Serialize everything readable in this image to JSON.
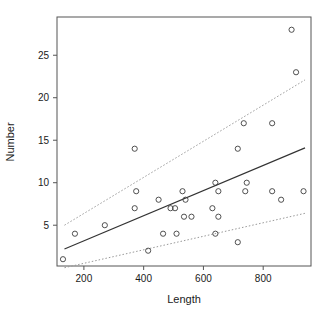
{
  "chart_data": {
    "type": "scatter",
    "title": "",
    "subtitle": "",
    "xlabel": "Length",
    "ylabel": "Number",
    "xlim": [
      110,
      960
    ],
    "ylim": [
      0.2,
      29.5
    ],
    "xticks": [
      200,
      400,
      600,
      800
    ],
    "yticks": [
      5,
      10,
      15,
      20,
      25
    ],
    "xtick_labels": [
      "200",
      "400",
      "600",
      "800"
    ],
    "ytick_labels": [
      "5",
      "10",
      "15",
      "20",
      "25"
    ],
    "grid": false,
    "legend": "none",
    "marker": "open-circle",
    "point_color": "#3d3d3d",
    "line_color": "#333333",
    "band_color": "#999999",
    "axis_color": "#555555",
    "points": [
      {
        "x": 130,
        "y": 1
      },
      {
        "x": 170,
        "y": 4
      },
      {
        "x": 270,
        "y": 5
      },
      {
        "x": 370,
        "y": 14
      },
      {
        "x": 375,
        "y": 9
      },
      {
        "x": 370,
        "y": 7
      },
      {
        "x": 415,
        "y": 2
      },
      {
        "x": 450,
        "y": 8
      },
      {
        "x": 465,
        "y": 4
      },
      {
        "x": 505,
        "y": 7
      },
      {
        "x": 490,
        "y": 7
      },
      {
        "x": 510,
        "y": 4
      },
      {
        "x": 530,
        "y": 9
      },
      {
        "x": 540,
        "y": 8
      },
      {
        "x": 535,
        "y": 6
      },
      {
        "x": 560,
        "y": 6
      },
      {
        "x": 630,
        "y": 7
      },
      {
        "x": 640,
        "y": 10
      },
      {
        "x": 650,
        "y": 9
      },
      {
        "x": 650,
        "y": 6
      },
      {
        "x": 640,
        "y": 4
      },
      {
        "x": 715,
        "y": 3
      },
      {
        "x": 715,
        "y": 14
      },
      {
        "x": 735,
        "y": 17
      },
      {
        "x": 745,
        "y": 10
      },
      {
        "x": 740,
        "y": 9
      },
      {
        "x": 830,
        "y": 17
      },
      {
        "x": 830,
        "y": 9
      },
      {
        "x": 860,
        "y": 8
      },
      {
        "x": 895,
        "y": 28
      },
      {
        "x": 910,
        "y": 23
      },
      {
        "x": 935,
        "y": 9
      }
    ],
    "fit_line": {
      "name": "regression line",
      "style": "solid",
      "x": [
        135,
        940
      ],
      "y": [
        2.2,
        14.1
      ]
    },
    "upper_band": {
      "name": "upper confidence band",
      "style": "dotted",
      "x": [
        135,
        940
      ],
      "y": [
        5.0,
        22.1
      ]
    },
    "lower_band": {
      "name": "lower confidence band",
      "style": "dotted",
      "x": [
        135,
        940
      ],
      "y": [
        0.0,
        6.4
      ]
    }
  }
}
